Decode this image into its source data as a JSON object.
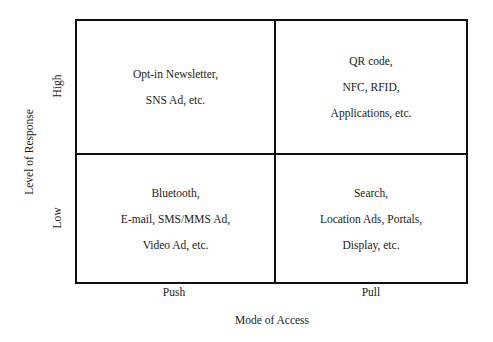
{
  "diagram": {
    "type": "2x2 matrix",
    "x_axis": {
      "label": "Mode of Access",
      "ticks": [
        "Push",
        "Pull"
      ]
    },
    "y_axis": {
      "label": "Level of Response",
      "ticks": [
        "High",
        "Low"
      ]
    },
    "quadrants": {
      "high_push": {
        "lines": [
          "Opt-in Newsletter,",
          "SNS Ad, etc."
        ]
      },
      "high_pull": {
        "lines": [
          "QR code,",
          "NFC, RFID,",
          "Applications, etc."
        ]
      },
      "low_push": {
        "lines": [
          "Bluetooth,",
          "E-mail, SMS/MMS Ad,",
          "Video Ad, etc."
        ]
      },
      "low_pull": {
        "lines": [
          "Search,",
          "Location Ads, Portals,",
          "Display, etc."
        ]
      }
    }
  }
}
